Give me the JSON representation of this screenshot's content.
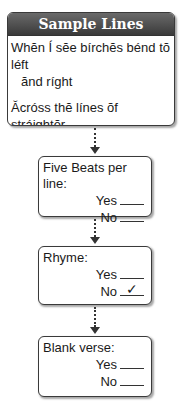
{
  "sample": {
    "title": "Sample Lines",
    "lines": [
      {
        "first": "Whĕn Í sĕe bírchĕs bénd tŏ léft",
        "second": "ănd ríght"
      },
      {
        "first": "Ăcróss thĕ línes ŏf stráightĕr",
        "second": "dárkĕr trées,"
      }
    ]
  },
  "questions": [
    {
      "title": "Five Beats per line:",
      "yes_label": "Yes",
      "no_label": "No",
      "checked": null
    },
    {
      "title": "Rhyme:",
      "yes_label": "Yes",
      "no_label": "No",
      "checked": "No"
    },
    {
      "title": "Blank verse:",
      "yes_label": "Yes",
      "no_label": "No",
      "checked": null
    }
  ],
  "check_mark": "✓"
}
